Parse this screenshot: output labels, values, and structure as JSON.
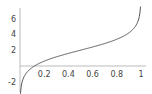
{
  "chart_data": {
    "type": "line",
    "title": "",
    "xlabel": "",
    "ylabel": "",
    "xlim": [
      0,
      1
    ],
    "ylim": [
      -3,
      7
    ],
    "x_ticks": [
      "0.2",
      "0.4",
      "0.6",
      "0.8",
      "1"
    ],
    "y_ticks": [
      "-2",
      "2",
      "4",
      "6"
    ],
    "grid": false,
    "series": [
      {
        "name": "curve",
        "x": [
          0.01,
          0.05,
          0.1,
          0.2,
          0.3,
          0.4,
          0.5,
          0.6,
          0.7,
          0.8,
          0.9,
          0.95,
          0.99
        ],
        "values": [
          -2.6,
          -0.94,
          -0.2,
          0.61,
          1.15,
          1.59,
          2.0,
          2.41,
          2.85,
          3.39,
          4.2,
          4.94,
          6.6
        ]
      }
    ],
    "colors": {
      "line": "#555555",
      "axis": "#999999"
    }
  }
}
